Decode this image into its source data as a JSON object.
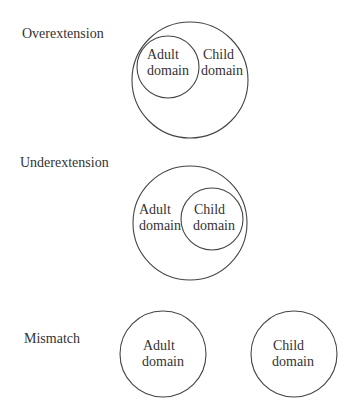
{
  "diagrams": [
    {
      "title": "Overextension",
      "title_pos": [
        22,
        38
      ],
      "circles": [
        {
          "cx": 190,
          "cy": 80,
          "r": 58,
          "role": "child"
        },
        {
          "cx": 168,
          "cy": 67,
          "r": 31,
          "role": "adult"
        }
      ],
      "labels": [
        {
          "line1": "Adult",
          "line2": "domain",
          "x": 147,
          "y": 59
        },
        {
          "line1": "Child",
          "line2": "domain",
          "x": 201,
          "y": 59
        }
      ]
    },
    {
      "title": "Underextension",
      "title_pos": [
        20,
        167
      ],
      "circles": [
        {
          "cx": 190,
          "cy": 223,
          "r": 57,
          "role": "adult"
        },
        {
          "cx": 212,
          "cy": 219,
          "r": 31,
          "role": "child"
        }
      ],
      "labels": [
        {
          "line1": "Adult",
          "line2": "domain",
          "x": 139,
          "y": 214
        },
        {
          "line1": "Child",
          "line2": "domain",
          "x": 193,
          "y": 214
        }
      ]
    },
    {
      "title": "Mismatch",
      "title_pos": [
        24,
        343
      ],
      "circles": [
        {
          "cx": 163,
          "cy": 354,
          "r": 43,
          "role": "adult"
        },
        {
          "cx": 294,
          "cy": 354,
          "r": 43,
          "role": "child"
        }
      ],
      "labels": [
        {
          "line1": "Adult",
          "line2": "domain",
          "x": 142,
          "y": 350
        },
        {
          "line1": "Child",
          "line2": "domain",
          "x": 272,
          "y": 350
        }
      ]
    }
  ]
}
